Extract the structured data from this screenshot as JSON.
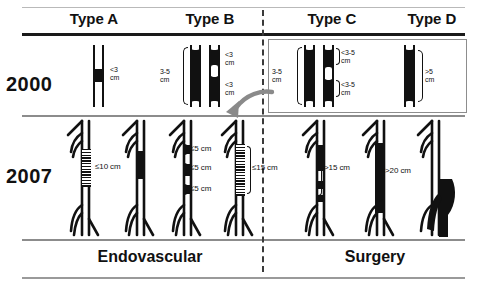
{
  "figure": {
    "title_row": {
      "types": [
        {
          "key": "A",
          "label": "Type A"
        },
        {
          "key": "B",
          "label": "Type B"
        },
        {
          "key": "C",
          "label": "Type C"
        },
        {
          "key": "D",
          "label": "Type D"
        }
      ]
    },
    "years": [
      {
        "key": "y2000",
        "label": "2000"
      },
      {
        "key": "y2007",
        "label": "2007"
      }
    ],
    "treatments": [
      {
        "key": "endovascular",
        "label": "Endovascular"
      },
      {
        "key": "surgery",
        "label": "Surgery"
      }
    ],
    "cells": {
      "y2000": {
        "type_a": {
          "measurements": [
            "<3\ncm"
          ]
        },
        "type_b": {
          "measurements": [
            "3-5\ncm",
            "<3\ncm",
            "<3\ncm"
          ]
        },
        "type_c": {
          "measurements": [
            "3-5\ncm",
            "<3-5\ncm",
            "<3-5\ncm"
          ]
        },
        "type_d": {
          "measurements": [
            ">5\ncm"
          ]
        }
      },
      "y2007": {
        "type_a": {
          "measurements": [
            "≤10 cm"
          ]
        },
        "type_b": {
          "measurements": [
            "≤5 cm",
            "≤5 cm",
            "≤5 cm",
            "≤15 cm"
          ]
        },
        "type_c": {
          "measurements": [
            ">15 cm"
          ]
        },
        "type_d": {
          "measurements": [
            ">20 cm"
          ]
        }
      }
    },
    "annotations": {
      "transition_arrow": "reclassification-arrow"
    },
    "colors": {
      "lesion": "#111111",
      "vessel_wall": "#111111",
      "divider": "#3a3a3a",
      "arrow": "#8a8a8a",
      "box_outline": "#8d8d8d"
    }
  }
}
